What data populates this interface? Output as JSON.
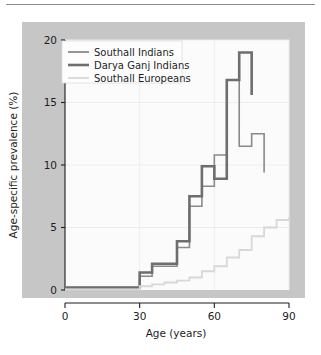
{
  "figure": {
    "background_color": "#ffffff",
    "panel_color": "#c6c6c6",
    "plot_color": "#fbfbfb"
  },
  "chart_data": {
    "type": "line",
    "step": "post",
    "title": "",
    "subtitle": "",
    "xlabel": "Age (years)",
    "ylabel": "Age-specific prevalence (%)",
    "xlim": [
      0,
      90
    ],
    "ylim": [
      0,
      20
    ],
    "xticks": [
      0,
      30,
      60,
      90
    ],
    "xtick_labels": [
      "0",
      "30",
      "60",
      "90"
    ],
    "yticks": [
      0,
      5,
      10,
      15,
      20
    ],
    "ytick_labels": [
      "0",
      "5",
      "10",
      "15",
      "20"
    ],
    "grid": true,
    "legend_position": "upper left",
    "series": [
      {
        "name": "Southall Indians",
        "color": "#8a8a8a",
        "linewidth": 1.6,
        "x": [
          0,
          30,
          35,
          40,
          45,
          50,
          55,
          60,
          65,
          70,
          75,
          80
        ],
        "values": [
          0.2,
          1.1,
          1.9,
          1.9,
          3.4,
          6.7,
          8.3,
          10.8,
          16.8,
          11.5,
          12.5,
          9.4
        ],
        "x_end": 80
      },
      {
        "name": "Darya Ganj Indians",
        "color": "#6e6e6e",
        "linewidth": 2.6,
        "x": [
          0,
          30,
          35,
          40,
          45,
          50,
          55,
          60,
          65,
          70,
          75
        ],
        "values": [
          0.2,
          1.4,
          2.1,
          2.1,
          3.9,
          7.5,
          9.9,
          8.9,
          16.8,
          19.0,
          15.6
        ],
        "x_end": 75
      },
      {
        "name": "Southall Europeans",
        "color": "#d8d8d8",
        "linewidth": 1.8,
        "x": [
          0,
          30,
          35,
          40,
          45,
          50,
          55,
          60,
          65,
          70,
          75,
          80,
          85,
          90
        ],
        "values": [
          0.05,
          0.3,
          0.45,
          0.6,
          0.75,
          1.0,
          1.5,
          1.9,
          2.6,
          3.2,
          4.3,
          5.0,
          5.6,
          5.8
        ],
        "x_end": 90
      }
    ],
    "annotations": []
  },
  "legend": {
    "entries": [
      {
        "label": "Southall Indians"
      },
      {
        "label": "Darya Ganj Indians"
      },
      {
        "label": "Southall Europeans"
      }
    ]
  }
}
